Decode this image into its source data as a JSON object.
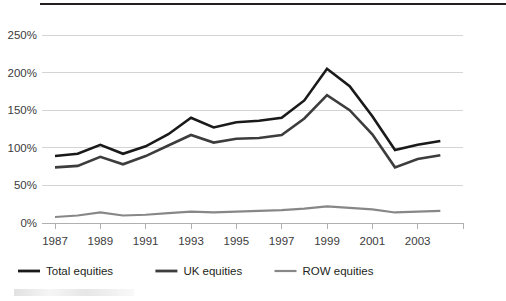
{
  "chart_data": {
    "type": "line",
    "title": "",
    "subtitle": "",
    "xlabel": "",
    "ylabel": "",
    "x": [
      1987,
      1988,
      1989,
      1990,
      1991,
      1992,
      1993,
      1994,
      1995,
      1996,
      1997,
      1998,
      1999,
      2000,
      2001,
      2002,
      2003,
      2004
    ],
    "xtick_labels": [
      "1987",
      "1989",
      "1991",
      "1993",
      "1995",
      "1997",
      "1999",
      "2001",
      "2003"
    ],
    "xtick_values": [
      1987,
      1989,
      1991,
      1993,
      1995,
      1997,
      1999,
      2001,
      2003
    ],
    "ytick_labels": [
      "0%",
      "50%",
      "100%",
      "150%",
      "200%",
      "250%"
    ],
    "ytick_values": [
      0,
      50,
      100,
      150,
      200,
      250
    ],
    "ylim": [
      0,
      250
    ],
    "xlim": [
      1987,
      2005
    ],
    "grid": true,
    "legend_position": "bottom-left",
    "series": [
      {
        "name": "Total equities",
        "legend_label": "Total equities",
        "color": "#1a1a1a",
        "width": 2.6,
        "values": [
          89,
          92,
          104,
          92,
          102,
          118,
          140,
          127,
          134,
          136,
          140,
          163,
          205,
          182,
          142,
          97,
          104,
          109
        ]
      },
      {
        "name": "UK equities",
        "legend_label": "UK equities",
        "color": "#3d3d3d",
        "width": 2.6,
        "values": [
          74,
          76,
          88,
          78,
          89,
          103,
          117,
          107,
          112,
          113,
          117,
          139,
          170,
          150,
          118,
          74,
          85,
          90
        ]
      },
      {
        "name": "ROW equities",
        "legend_label": "ROW equities",
        "color": "#878787",
        "width": 2.2,
        "values": [
          8,
          10,
          14,
          10,
          11,
          13,
          15,
          14,
          15,
          16,
          17,
          19,
          22,
          20,
          18,
          14,
          15,
          16
        ]
      }
    ]
  },
  "legend": {
    "items": [
      {
        "label": "Total equities",
        "color": "#1a1a1a"
      },
      {
        "label": "UK equities",
        "color": "#3d3d3d"
      },
      {
        "label": "ROW equities",
        "color": "#878787"
      }
    ]
  },
  "colors": {
    "total": "#1a1a1a",
    "uk": "#3d3d3d",
    "row": "#878787",
    "grid": "#d4d4d4",
    "axis": "#b0b0b0",
    "rule": "#231f20",
    "text": "#3b3b3b",
    "background": "#ffffff"
  }
}
